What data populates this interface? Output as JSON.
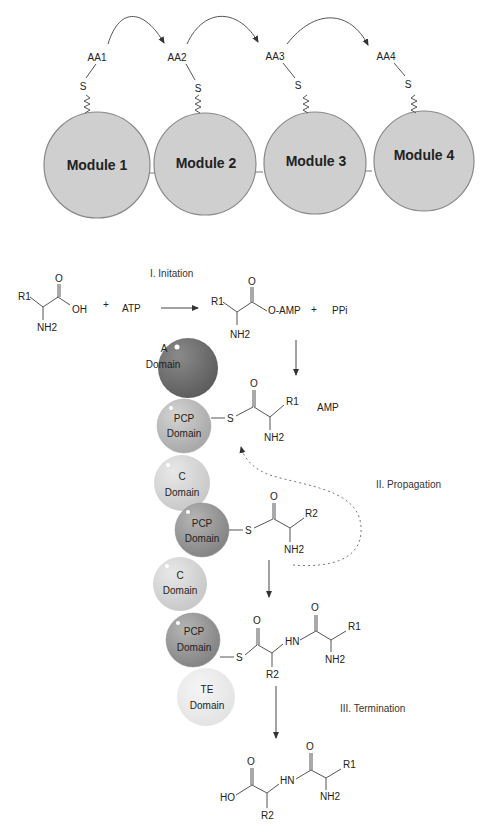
{
  "modules": {
    "labels": [
      "Module  1",
      "Module 2",
      "Module 3",
      "Module 4"
    ],
    "amino_acids": [
      "AA1",
      "AA2",
      "AA3",
      "AA4"
    ],
    "thiol_label": "S",
    "fill_color": "#cfcfcf"
  },
  "initiation": {
    "stage_label": "I. Initation",
    "reactant_r": "R1",
    "reactant_o": "O",
    "reactant_oh": "OH",
    "reactant_nh2": "NH2",
    "plus1": "+",
    "atp": "ATP",
    "product_r": "R1",
    "product_o": "O",
    "product_oamp": "O-AMP",
    "product_nh2": "NH2",
    "plus2": "+",
    "ppi": "PPi"
  },
  "domains": {
    "a": {
      "line1": "A",
      "line2": "Domain",
      "color": "#6e6e6e"
    },
    "pcp1": {
      "line1": "PCP",
      "line2": "Domain",
      "color": "#bdbdbd"
    },
    "c1": {
      "line1": "C",
      "line2": "Domain",
      "color": "#d9d9d9"
    },
    "pcp2": {
      "line1": "PCP",
      "line2": "Domain",
      "color": "#9a9a9a"
    },
    "c2": {
      "line1": "C",
      "line2": "Domain",
      "color": "#d4d4d4"
    },
    "pcp3": {
      "line1": "PCP",
      "line2": "Domain",
      "color": "#999999"
    },
    "te": {
      "line1": "TE",
      "line2": "Domain",
      "color": "#ececec"
    }
  },
  "propagation": {
    "stage_label": "II. Propagation",
    "thioester1": {
      "s": "S",
      "o": "O",
      "r": "R1",
      "nh2": "NH2"
    },
    "amp": "AMP",
    "thioester2": {
      "s": "S",
      "o": "O",
      "r": "R2",
      "nh2": "NH2"
    },
    "dipeptidyl": {
      "s": "S",
      "o1": "O",
      "r2": "R2",
      "hn": "HN",
      "o2": "O",
      "r1": "R1",
      "nh2": "NH2"
    }
  },
  "termination": {
    "stage_label": "III. Termination",
    "product": {
      "ho": "HO",
      "o1": "O",
      "r2": "R2",
      "hn": "HN",
      "o2": "O",
      "r1": "R1",
      "nh2": "NH2"
    }
  }
}
